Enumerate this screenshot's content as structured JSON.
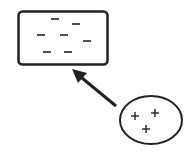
{
  "diagram": {
    "negative_region": {
      "shape": "rounded-rectangle",
      "charge_symbol": "−",
      "charge_count": 7
    },
    "positive_object": {
      "shape": "ellipse",
      "charge_symbol": "+",
      "charge_count": 3
    },
    "arrow": {
      "from": "positive_object",
      "to": "negative_region"
    },
    "colors": {
      "stroke": "#222222",
      "background": "#ffffff"
    }
  }
}
